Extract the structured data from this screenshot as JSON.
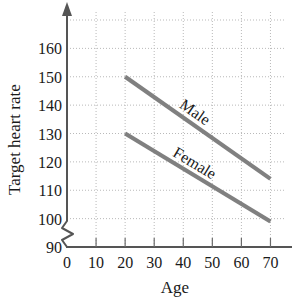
{
  "chart_data": {
    "type": "line",
    "title": "",
    "subtitle": "",
    "xlabel": "Age",
    "ylabel": "Target heart rate",
    "xlim": [
      0,
      75
    ],
    "ylim": [
      90,
      170
    ],
    "xticks": [
      "0",
      "10",
      "20",
      "30",
      "40",
      "50",
      "60",
      "70"
    ],
    "xtick_values": [
      0,
      10,
      20,
      30,
      40,
      50,
      60,
      70
    ],
    "yticks": [
      "90",
      "100",
      "110",
      "120",
      "130",
      "140",
      "150",
      "160"
    ],
    "ytick_values": [
      90,
      100,
      110,
      120,
      130,
      140,
      150,
      160
    ],
    "grid": true,
    "grid_style": "dotted",
    "y_axis_break": true,
    "y_axis_arrow": true,
    "legend": "inline-labels",
    "legend_position": "on-line",
    "series": [
      {
        "name": "Male",
        "color": "#808080",
        "x": [
          20,
          70
        ],
        "values": [
          150,
          114
        ],
        "slope_per_year": -0.72,
        "label": "Male"
      },
      {
        "name": "Female",
        "color": "#808080",
        "x": [
          20,
          70
        ],
        "values": [
          130,
          99
        ],
        "slope_per_year": -0.62,
        "label": "Female"
      }
    ],
    "annotations": [
      {
        "text": "Male",
        "x": 43,
        "y": 136
      },
      {
        "text": "Female",
        "x": 43,
        "y": 118
      }
    ]
  },
  "axis": {
    "y_title": "Target heart rate",
    "x_title": "Age"
  },
  "colors": {
    "line": "#808080",
    "grid": "#b9b9b9",
    "axis": "#555555",
    "text": "#1a1a1a"
  }
}
